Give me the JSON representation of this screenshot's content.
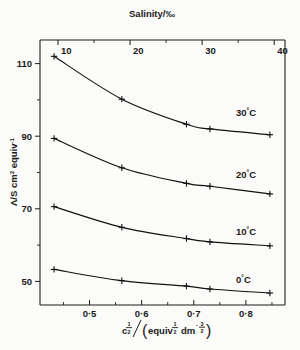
{
  "figure": {
    "title_top_axis": "Salinity/",
    "title_top_axis_unit": "‰",
    "background": "#fbfbf9",
    "ink": "#111111"
  },
  "axes": {
    "top": {
      "label": "Salinity/‰",
      "ticks": [
        "10",
        "20",
        "30",
        "40"
      ],
      "tick_values": [
        10,
        20,
        30,
        40
      ],
      "range": [
        7.5,
        41.5
      ]
    },
    "bottom": {
      "label_parts": {
        "c": "c",
        "c_exp": "1/2",
        "slash": "/",
        "open": "(",
        "equiv": "equiv",
        "equiv_exp": "1/2",
        "dm": "dm",
        "dm_exp": "-3/2",
        "close": ")"
      },
      "label_plain": "c½/(equiv½ dm⁻³ᐟ²)",
      "ticks": [
        "0·5",
        "0·6",
        "0·7",
        "0·8"
      ],
      "tick_values": [
        0.5,
        0.6,
        0.7,
        0.8
      ],
      "minor_tick_values": [
        0.45,
        0.55,
        0.65,
        0.75,
        0.85
      ],
      "range": [
        0.405,
        0.875
      ]
    },
    "left": {
      "label_plain": "Λ/S cm² equiv⁻¹",
      "label_parts": {
        "lambda": "Λ",
        "slash": "/S cm",
        "cm_exp": "2",
        "equiv": " equiv",
        "equiv_exp": "-1"
      },
      "ticks": [
        "110",
        "90",
        "70",
        "50"
      ],
      "tick_values": [
        110,
        90,
        70,
        50
      ],
      "minor_tick_values": [
        100,
        80,
        60
      ],
      "range": [
        43.5,
        116.5
      ]
    }
  },
  "chart_data": {
    "type": "line",
    "title": "",
    "xlabel": "c½/(equiv½ dm⁻³ᐟ²)",
    "ylabel": "Λ/S cm² equiv⁻¹",
    "xlabel_top": "Salinity/‰",
    "xlim": [
      0.405,
      0.875
    ],
    "ylim": [
      43.5,
      116.5
    ],
    "xlim_top": [
      7.5,
      41.5
    ],
    "grid": false,
    "legend": "inline-right",
    "marker": "plus",
    "series": [
      {
        "name": "30°C",
        "label_temp": "30",
        "label_unit": "°C",
        "x": [
          0.432,
          0.562,
          0.686,
          0.731,
          0.846
        ],
        "y": [
          112.0,
          100.2,
          93.3,
          92.0,
          90.4
        ]
      },
      {
        "name": "20°C",
        "label_temp": "20",
        "label_unit": "°C",
        "x": [
          0.432,
          0.562,
          0.686,
          0.731,
          0.846
        ],
        "y": [
          89.4,
          81.3,
          77.0,
          76.2,
          74.1
        ]
      },
      {
        "name": "10°C",
        "label_temp": "10",
        "label_unit": "°C",
        "x": [
          0.432,
          0.562,
          0.686,
          0.731,
          0.846
        ],
        "y": [
          70.6,
          64.9,
          61.8,
          60.9,
          59.8
        ]
      },
      {
        "name": "0°C",
        "label_temp": "0",
        "label_unit": "°C",
        "x": [
          0.432,
          0.562,
          0.686,
          0.731,
          0.846
        ],
        "y": [
          53.3,
          50.2,
          48.7,
          47.9,
          46.8
        ]
      }
    ]
  }
}
